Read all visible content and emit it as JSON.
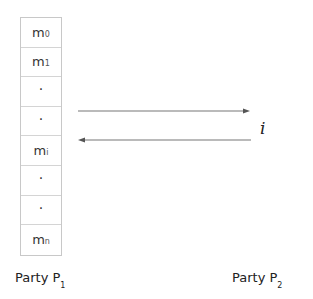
{
  "diagram": {
    "stack_cells": [
      {
        "base": "m",
        "sub": "0"
      },
      {
        "base": "m",
        "sub": "1"
      },
      {
        "base": "·",
        "sub": ""
      },
      {
        "base": "·",
        "sub": ""
      },
      {
        "base": "m",
        "sub": "i"
      },
      {
        "base": "·",
        "sub": ""
      },
      {
        "base": "·",
        "sub": ""
      },
      {
        "base": "m",
        "sub": "n"
      }
    ],
    "index_label": "i",
    "party1": {
      "label": "Party P",
      "sub": "1"
    },
    "party2": {
      "label": "Party P",
      "sub": "2"
    },
    "arrows": [
      {
        "direction": "right",
        "from": "P1",
        "to": "P2"
      },
      {
        "direction": "left",
        "from": "P2",
        "to": "P1"
      }
    ],
    "colors": {
      "arrow": "#777777",
      "border": "#c8c8c8"
    }
  }
}
